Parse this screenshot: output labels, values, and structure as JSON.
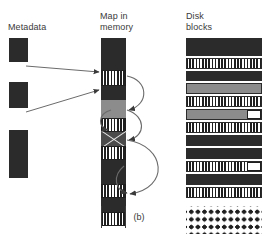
{
  "figure": {
    "caption": "(b)",
    "columns": {
      "metadata": "Metadata",
      "map": "Map in\nmemory",
      "disk": "Disk\nblocks"
    }
  },
  "metadata_column": {
    "name": "Metadata",
    "segments": [
      {
        "index": 0,
        "fill": "dark",
        "top": 0,
        "height": 24
      },
      {
        "index": 1,
        "fill": "white",
        "top": 24,
        "height": 20
      },
      {
        "index": 2,
        "fill": "dark",
        "top": 44,
        "height": 26
      },
      {
        "index": 3,
        "fill": "white",
        "top": 70,
        "height": 22
      },
      {
        "index": 4,
        "fill": "dark",
        "top": 92,
        "height": 48
      },
      {
        "index": 5,
        "fill": "white",
        "top": 140,
        "height": 28
      }
    ]
  },
  "map_column": {
    "name": "Map in memory",
    "segments": [
      {
        "index": 0,
        "fill": "dark",
        "top": 0,
        "height": 32
      },
      {
        "index": 1,
        "fill": "checker",
        "top": 32,
        "height": 16
      },
      {
        "index": 2,
        "fill": "dark",
        "top": 48,
        "height": 14
      },
      {
        "index": 3,
        "fill": "gray",
        "top": 62,
        "height": 18
      },
      {
        "index": 4,
        "fill": "checker",
        "top": 80,
        "height": 14
      },
      {
        "index": 5,
        "fill": "cross",
        "top": 94,
        "height": 14
      },
      {
        "index": 6,
        "fill": "checker",
        "top": 108,
        "height": 14
      },
      {
        "index": 7,
        "fill": "dark",
        "top": 122,
        "height": 24
      },
      {
        "index": 8,
        "fill": "checker",
        "top": 146,
        "height": 14
      },
      {
        "index": 9,
        "fill": "dark",
        "top": 160,
        "height": 14
      },
      {
        "index": 10,
        "fill": "checker",
        "top": 174,
        "height": 14
      },
      {
        "index": 11,
        "fill": "white",
        "top": 188,
        "height": 20
      }
    ]
  },
  "disk_blocks": {
    "name": "Disk blocks",
    "rows": [
      {
        "index": 0,
        "fill": "dark",
        "top": 0,
        "height": 18,
        "notch": false
      },
      {
        "index": 1,
        "fill": "checker",
        "top": 20,
        "height": 11,
        "notch": false
      },
      {
        "index": 2,
        "fill": "dark",
        "top": 33,
        "height": 10,
        "notch": false
      },
      {
        "index": 3,
        "fill": "gray",
        "top": 45,
        "height": 11,
        "notch": false
      },
      {
        "index": 4,
        "fill": "checker",
        "top": 58,
        "height": 11,
        "notch": false
      },
      {
        "index": 5,
        "fill": "gray",
        "top": 71,
        "height": 11,
        "notch": true
      },
      {
        "index": 6,
        "fill": "checker",
        "top": 84,
        "height": 11,
        "notch": false
      },
      {
        "index": 7,
        "fill": "dark",
        "top": 97,
        "height": 11,
        "notch": false
      },
      {
        "index": 8,
        "fill": "dark",
        "top": 110,
        "height": 11,
        "notch": false
      },
      {
        "index": 9,
        "fill": "checker",
        "top": 123,
        "height": 11,
        "notch": true
      },
      {
        "index": 10,
        "fill": "dark",
        "top": 136,
        "height": 11,
        "notch": false
      },
      {
        "index": 11,
        "fill": "checker",
        "top": 149,
        "height": 11,
        "notch": false
      }
    ],
    "free_grid": {
      "top": 168,
      "height": 38,
      "rows": 5,
      "cols": 11
    }
  },
  "arrows": {
    "metadata_to_map": [
      {
        "from": "metadata-segment-1",
        "to": "map-segment-1"
      },
      {
        "from": "metadata-segment-3",
        "to": "map-segment-3"
      }
    ],
    "map_chain": [
      {
        "from": "map-segment-1",
        "to": "map-segment-4"
      },
      {
        "from": "map-segment-4",
        "to": "map-segment-4-back"
      },
      {
        "from": "map-segment-4",
        "to": "map-segment-6"
      },
      {
        "from": "map-segment-6",
        "to": "map-segment-10"
      },
      {
        "from": "map-segment-8",
        "to": "map-segment-10"
      }
    ]
  },
  "colors": {
    "dark": "#2b2b2b",
    "gray": "#8c8c8c",
    "white": "#ffffff",
    "ink": "#1f1f1f",
    "text": "#3a3a3a"
  }
}
